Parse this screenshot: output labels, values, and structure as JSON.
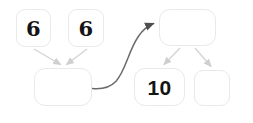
{
  "diagram": {
    "colors": {
      "box_border": "#e9e9e9",
      "box_fill": "#ffffff",
      "arrow": "#c9c9c9",
      "curve_arrow": "#5a5a5a",
      "text": "#141414",
      "background": "#ffffff"
    },
    "nodes": [
      {
        "id": "addend-left",
        "label": "6",
        "empty": false,
        "role": "part"
      },
      {
        "id": "addend-right",
        "label": "6",
        "empty": false,
        "role": "part"
      },
      {
        "id": "sum-left",
        "label": "",
        "empty": true,
        "role": "whole"
      },
      {
        "id": "whole-right",
        "label": "",
        "empty": true,
        "role": "whole"
      },
      {
        "id": "part-ten",
        "label": "10",
        "empty": false,
        "role": "part"
      },
      {
        "id": "part-empty",
        "label": "",
        "empty": true,
        "role": "part"
      }
    ],
    "connectors": [
      {
        "id": "addend-left-to-sum",
        "from": "addend-left",
        "to": "sum-left",
        "style": "straight",
        "arrowhead": true
      },
      {
        "id": "addend-right-to-sum",
        "from": "addend-right",
        "to": "sum-left",
        "style": "straight",
        "arrowhead": true
      },
      {
        "id": "sum-to-whole-right",
        "from": "sum-left",
        "to": "whole-right",
        "style": "curved",
        "arrowhead": true
      },
      {
        "id": "whole-to-part-ten",
        "from": "whole-right",
        "to": "part-ten",
        "style": "straight",
        "arrowhead": true
      },
      {
        "id": "whole-to-part-empty",
        "from": "whole-right",
        "to": "part-empty",
        "style": "straight",
        "arrowhead": true
      }
    ]
  }
}
